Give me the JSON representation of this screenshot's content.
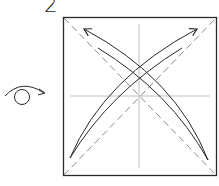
{
  "diagram": {
    "step_number": "2",
    "symbols": {
      "turn_over": "turn-over-icon"
    },
    "colors": {
      "outline": "#2a2a2a",
      "fold_line": "#9a9a9a",
      "valley_fold": "#8a8a8a",
      "arrow": "#2a2a2a",
      "background": "#ffffff"
    },
    "paper": {
      "x": 63,
      "y": 17,
      "width": 153,
      "height": 158
    },
    "elements": [
      {
        "type": "square",
        "label": "paper"
      },
      {
        "type": "crease",
        "label": "vertical center crease"
      },
      {
        "type": "crease",
        "label": "horizontal center crease"
      },
      {
        "type": "valley-fold",
        "label": "diagonal bottom-left to top-right"
      },
      {
        "type": "valley-fold",
        "label": "diagonal top-left to bottom-right"
      },
      {
        "type": "fold-arrow",
        "label": "bottom-left corner to top-right corner"
      },
      {
        "type": "fold-arrow",
        "label": "bottom-right corner to top-left corner"
      }
    ]
  }
}
